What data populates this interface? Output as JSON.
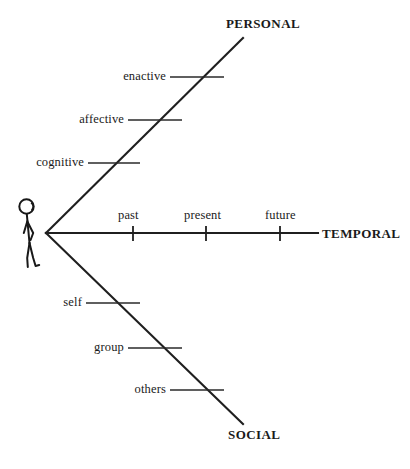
{
  "diagram": {
    "background_color": "#ffffff",
    "ink_color": "#1a1a1a",
    "origin_label": "person",
    "axes": [
      {
        "id": "personal",
        "name": "PERSONAL",
        "direction": "upper-right diagonal",
        "ticks": [
          {
            "label": "cognitive",
            "order": 1
          },
          {
            "label": "affective",
            "order": 2
          },
          {
            "label": "enactive",
            "order": 3
          }
        ]
      },
      {
        "id": "temporal",
        "name": "TEMPORAL",
        "direction": "horizontal right",
        "ticks": [
          {
            "label": "past",
            "order": 1
          },
          {
            "label": "present",
            "order": 2
          },
          {
            "label": "future",
            "order": 3
          }
        ]
      },
      {
        "id": "social",
        "name": "SOCIAL",
        "direction": "lower-right diagonal",
        "ticks": [
          {
            "label": "self",
            "order": 1
          },
          {
            "label": "group",
            "order": 2
          },
          {
            "label": "others",
            "order": 3
          }
        ]
      }
    ],
    "icons": {
      "person": "stick-figure-icon"
    }
  }
}
